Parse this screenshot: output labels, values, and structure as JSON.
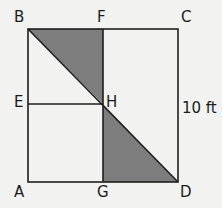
{
  "diagram": {
    "type": "geometry",
    "points": {
      "A": {
        "label": "A"
      },
      "B": {
        "label": "B"
      },
      "C": {
        "label": "C"
      },
      "D": {
        "label": "D"
      },
      "E": {
        "label": "E"
      },
      "F": {
        "label": "F"
      },
      "G": {
        "label": "G"
      },
      "H": {
        "label": "H"
      }
    },
    "side_label": "10 ft",
    "shaded_regions": [
      "triangle BFH",
      "triangle HGD"
    ],
    "colors": {
      "shade": "#7d7d7d",
      "line": "#1e1e1e",
      "background": "#f2f2f1"
    }
  }
}
